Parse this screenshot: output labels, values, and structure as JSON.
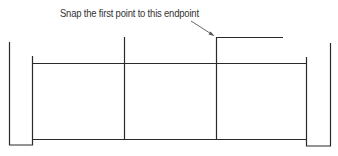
{
  "annotation": {
    "text": "Snap the first point to this endpoint"
  },
  "colors": {
    "line": "#2a2a2a",
    "arrow": "#555555",
    "background": "#ffffff"
  },
  "geometry": {
    "left_post": {
      "x1": 9,
      "x2": 32,
      "top": 42,
      "bottom": 145
    },
    "right_post": {
      "x1": 306,
      "x2": 330,
      "top": 43,
      "bottom": 146
    },
    "top_rail_y": 63,
    "bottom_rail_y": 139,
    "dividers_x": [
      124,
      216
    ],
    "target_endpoint": {
      "x": 216,
      "y": 37
    },
    "open_segment_end_x": 283
  }
}
